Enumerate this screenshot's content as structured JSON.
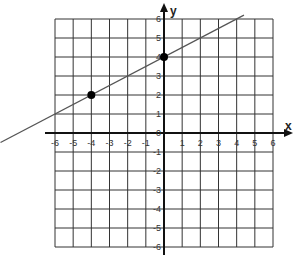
{
  "chart_data": {
    "type": "line",
    "title": "",
    "xlabel": "x",
    "ylabel": "y",
    "xlim": [
      -6,
      6
    ],
    "ylim": [
      -6,
      6
    ],
    "grid": true,
    "x_ticks": [
      -6,
      -5,
      -4,
      -3,
      -2,
      -1,
      1,
      2,
      3,
      4,
      5,
      6
    ],
    "y_ticks": [
      6,
      5,
      4,
      3,
      2,
      1,
      0,
      -1,
      -2,
      -3,
      -4,
      -5,
      -6
    ],
    "x_tick_labels": [
      "-6",
      "-5",
      "-4",
      "-3",
      "-2",
      "-1",
      "1",
      "2",
      "3",
      "4",
      "5",
      "6"
    ],
    "y_tick_labels": [
      "6",
      "5",
      "4",
      "3",
      "2",
      "1",
      "0",
      "-1",
      "-2",
      "-3",
      "-4",
      "-5",
      "-6"
    ],
    "series": [
      {
        "name": "line",
        "equation": "y = 0.5x + 4",
        "slope": 0.5,
        "intercept": 4,
        "x": [
          -9,
          4.4
        ],
        "y": [
          -0.5,
          6.2
        ]
      }
    ],
    "points": [
      {
        "x": -4,
        "y": 2
      },
      {
        "x": 0,
        "y": 4
      }
    ],
    "legend": null
  },
  "colors": {
    "grid": "#333333",
    "axis": "#111111",
    "line": "#555555",
    "point": "#000000"
  }
}
